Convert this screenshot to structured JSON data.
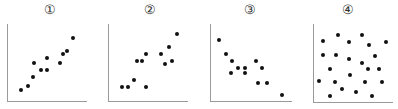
{
  "chart_data": [
    {
      "type": "scatter",
      "title": "①",
      "xlabel": "",
      "ylabel": "",
      "xlim": [
        0,
        100
      ],
      "ylim": [
        0,
        100
      ],
      "grid": false,
      "description": "strong positive correlation",
      "points": [
        [
          18,
          16
        ],
        [
          26,
          21
        ],
        [
          33,
          32
        ],
        [
          43,
          41
        ],
        [
          50,
          41
        ],
        [
          34,
          50
        ],
        [
          66,
          50
        ],
        [
          50,
          57
        ],
        [
          70,
          61
        ],
        [
          75,
          65
        ],
        [
          83,
          82
        ]
      ]
    },
    {
      "type": "scatter",
      "title": "②",
      "xlabel": "",
      "ylabel": "",
      "xlim": [
        0,
        100
      ],
      "ylim": [
        0,
        100
      ],
      "grid": false,
      "description": "weak positive correlation",
      "points": [
        [
          17,
          19
        ],
        [
          25,
          19
        ],
        [
          32,
          28
        ],
        [
          48,
          19
        ],
        [
          36,
          53
        ],
        [
          43,
          53
        ],
        [
          48,
          61
        ],
        [
          66,
          61
        ],
        [
          71,
          49
        ],
        [
          80,
          52
        ],
        [
          76,
          71
        ],
        [
          86,
          87
        ]
      ]
    },
    {
      "type": "scatter",
      "title": "③",
      "xlabel": "",
      "ylabel": "",
      "xlim": [
        0,
        100
      ],
      "ylim": [
        0,
        100
      ],
      "grid": false,
      "description": "negative correlation",
      "points": [
        [
          11,
          79
        ],
        [
          19,
          61
        ],
        [
          27,
          52
        ],
        [
          34,
          44
        ],
        [
          43,
          44
        ],
        [
          26,
          37
        ],
        [
          43,
          37
        ],
        [
          56,
          53
        ],
        [
          64,
          44
        ],
        [
          59,
          25
        ],
        [
          69,
          25
        ],
        [
          88,
          9
        ]
      ]
    },
    {
      "type": "scatter",
      "title": "④",
      "xlabel": "",
      "ylabel": "",
      "xlim": [
        0,
        100
      ],
      "ylim": [
        0,
        100
      ],
      "grid": false,
      "description": "no correlation",
      "points": [
        [
          31,
          86
        ],
        [
          61,
          86
        ],
        [
          12,
          78
        ],
        [
          45,
          77
        ],
        [
          70,
          73
        ],
        [
          91,
          77
        ],
        [
          12,
          61
        ],
        [
          29,
          61
        ],
        [
          45,
          56
        ],
        [
          61,
          51
        ],
        [
          78,
          60
        ],
        [
          21,
          43
        ],
        [
          69,
          43
        ],
        [
          83,
          43
        ],
        [
          46,
          35
        ],
        [
          7,
          28
        ],
        [
          27,
          27
        ],
        [
          65,
          27
        ],
        [
          86,
          27
        ],
        [
          36,
          18
        ],
        [
          54,
          14
        ],
        [
          21,
          9
        ],
        [
          74,
          9
        ]
      ]
    }
  ],
  "panels": [
    {
      "label": "①",
      "left": 0,
      "frame": {
        "x": 7,
        "y": 24,
        "w": 80,
        "h": 78
      }
    },
    {
      "label": "②",
      "left": 100,
      "frame": {
        "x": 8,
        "y": 24,
        "w": 80,
        "h": 78
      }
    },
    {
      "label": "③",
      "left": 200,
      "frame": {
        "x": 10,
        "y": 24,
        "w": 82,
        "h": 78
      }
    },
    {
      "label": "④",
      "left": 298,
      "frame": {
        "x": 15,
        "y": 24,
        "w": 80,
        "h": 79
      }
    }
  ],
  "colors": {
    "point": "#111111",
    "axis": "#9a9a9a",
    "label": "#333333"
  }
}
